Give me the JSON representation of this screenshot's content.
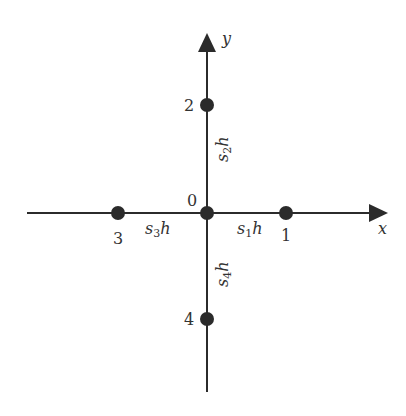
{
  "diagram": {
    "title": "",
    "colors": {
      "ink": "#2b2b2b",
      "text": "#333333",
      "background": "#ffffff"
    },
    "axes": {
      "x": {
        "label": "x"
      },
      "y": {
        "label": "y"
      }
    },
    "nodes": [
      {
        "id": "0",
        "label": "0"
      },
      {
        "id": "1",
        "label": "1"
      },
      {
        "id": "2",
        "label": "2"
      },
      {
        "id": "3",
        "label": "3"
      },
      {
        "id": "4",
        "label": "4"
      }
    ],
    "spacings": [
      {
        "id": "s1h",
        "base": "s",
        "sub": "1",
        "var": "h"
      },
      {
        "id": "s2h",
        "base": "s",
        "sub": "2",
        "var": "h"
      },
      {
        "id": "s3h",
        "base": "s",
        "sub": "3",
        "var": "h"
      },
      {
        "id": "s4h",
        "base": "s",
        "sub": "4",
        "var": "h"
      }
    ]
  }
}
